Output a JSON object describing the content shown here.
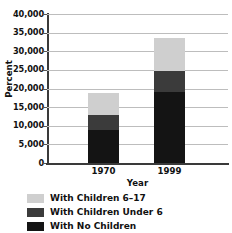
{
  "title": {
    "text": "",
    "note": "chart title cropped off at top edge"
  },
  "chart_data": {
    "type": "bar",
    "subtype": "stacked",
    "title": "",
    "xlabel": "Year",
    "ylabel": "Percent",
    "categories": [
      "1970",
      "1999"
    ],
    "ylim": [
      0,
      40000
    ],
    "yticks": [
      0,
      5000,
      10000,
      15000,
      20000,
      25000,
      30000,
      35000,
      40000
    ],
    "ytick_labels": [
      "0",
      "5,000",
      "10,000",
      "15,000",
      "20,000",
      "25,000",
      "30,000",
      "35,000",
      "40,000"
    ],
    "grid": true,
    "grid_axis": "y",
    "legend_position": "below",
    "stack_order_bottom_to_top": [
      "With No Children",
      "With Children Under 6",
      "With Children 6–17"
    ],
    "series": [
      {
        "name": "With No Children",
        "color": "#141414",
        "values": [
          8900,
          19000
        ]
      },
      {
        "name": "With Children Under 6",
        "color": "#3b3b3b",
        "values": [
          4000,
          5700
        ]
      },
      {
        "name": "With Children 6–17",
        "color": "#cfcfcf",
        "values": [
          5900,
          8900
        ]
      }
    ],
    "totals": [
      18800,
      33600
    ]
  },
  "yticks": [
    {
      "label": "40,000",
      "value": 40000
    },
    {
      "label": "35,000",
      "value": 35000
    },
    {
      "label": "30,000",
      "value": 30000
    },
    {
      "label": "25,000",
      "value": 25000
    },
    {
      "label": "20,000",
      "value": 20000
    },
    {
      "label": "15,000",
      "value": 15000
    },
    {
      "label": "10,000",
      "value": 10000
    },
    {
      "label": "5,000",
      "value": 5000
    },
    {
      "label": "0",
      "value": 0
    }
  ],
  "axes": {
    "y_title": "Percent",
    "x_title": "Year"
  },
  "xticks": [
    {
      "label": "1970"
    },
    {
      "label": "1999"
    }
  ],
  "legend": {
    "items": [
      {
        "label": "With Children 6–17",
        "color": "#cfcfcf"
      },
      {
        "label": "With Children Under 6",
        "color": "#3b3b3b"
      },
      {
        "label": "With No Children",
        "color": "#141414"
      }
    ]
  }
}
